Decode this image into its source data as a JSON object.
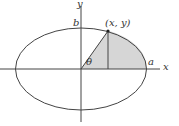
{
  "diagram": {
    "type": "ellipse-sector",
    "labels": {
      "y_axis": "y",
      "x_axis": "x",
      "b": "b",
      "a": "a",
      "point": "(x, y)",
      "angle": "θ"
    },
    "colors": {
      "line": "#333333",
      "shade": "#d6d6d6"
    }
  }
}
